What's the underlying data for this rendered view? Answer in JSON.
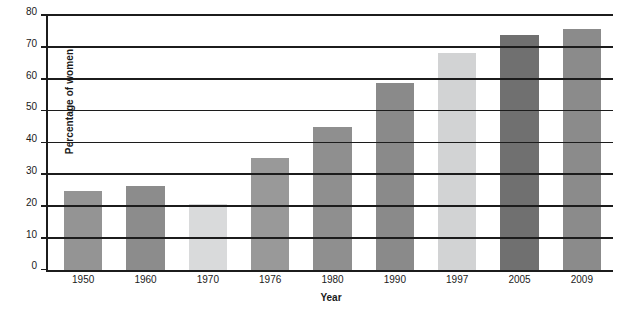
{
  "chart_data": {
    "type": "bar",
    "title": "",
    "xlabel": "Year",
    "ylabel": "Percentage of women",
    "categories": [
      "1950",
      "1960",
      "1970",
      "1976",
      "1980",
      "1990",
      "1997",
      "2005",
      "2009"
    ],
    "values": [
      25,
      26.5,
      21,
      35.5,
      45,
      59,
      68.5,
      74,
      76
    ],
    "bar_colors": [
      "#949494",
      "#8c8c8c",
      "#d9dadb",
      "#999999",
      "#8f8f8f",
      "#8a8a8a",
      "#d2d3d4",
      "#707070",
      "#8b8b8b"
    ],
    "ylim": [
      0,
      80
    ],
    "yticks": [
      0,
      10,
      20,
      30,
      40,
      50,
      60,
      70,
      80
    ],
    "ytick_labels": [
      "0",
      "10",
      "20",
      "30",
      "40",
      "50",
      "60",
      "70",
      "80"
    ],
    "grid": true,
    "grid_axis": "y",
    "legend": false,
    "axis_color": "#1c1c1c"
  },
  "caption": ""
}
